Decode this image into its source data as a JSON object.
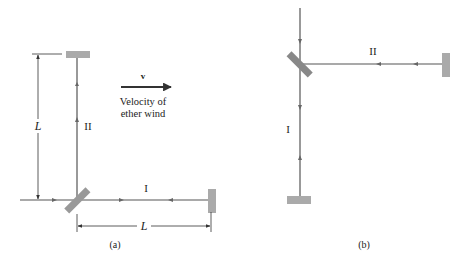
{
  "figure_a": {
    "caption": "(a)",
    "arm_I_label": "I",
    "arm_II_label": "II",
    "length_vertical": "L",
    "length_horizontal": "L",
    "velocity_symbol": "v",
    "velocity_text_line1": "Velocity of",
    "velocity_text_line2": "ether wind"
  },
  "figure_b": {
    "caption": "(b)",
    "arm_I_label": "I",
    "arm_II_label": "II"
  },
  "colors": {
    "beam": "#555555",
    "mirror": "#aaaaaa",
    "splitter": "#888888",
    "text": "#222222"
  }
}
